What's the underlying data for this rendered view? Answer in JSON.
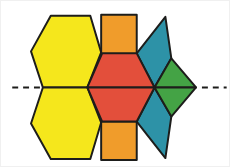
{
  "figure": {
    "canvas": {
      "width": 230,
      "height": 167,
      "background": "#ffffff"
    },
    "outline": {
      "color": "#1d1d1b",
      "width": 2
    },
    "colors": {
      "yellow": "#f5e71c",
      "orange": "#f09c2b",
      "red": "#e34f3b",
      "teal": "#2d92a7",
      "green": "#44a345"
    },
    "symmetry_line": {
      "color": "#1d1d1b",
      "width": 2,
      "dash": "6 5",
      "segments": [
        {
          "x1": 11,
          "y1": 87.5,
          "x2": 41,
          "y2": 87.5
        },
        {
          "x1": 203,
          "y1": 87.5,
          "x2": 228,
          "y2": 87.5
        }
      ]
    },
    "shapes": [
      {
        "name": "yellow-hexagon-top",
        "color": "yellow",
        "points": "30,51 50,15 90,15 101,52 87,87.5 42,87.5"
      },
      {
        "name": "yellow-hexagon-bottom",
        "color": "yellow",
        "points": "30,124 42,87.5 87,87.5 101,123 90,160 50,160"
      },
      {
        "name": "orange-square-top",
        "color": "orange",
        "points": "101,14 137,14 137,53 101,53"
      },
      {
        "name": "orange-square-bottom",
        "color": "orange",
        "points": "101,122 137,122 137,161 101,161"
      },
      {
        "name": "teal-rhombus-top",
        "color": "teal",
        "points": "155,87.5 137,53 166,16 172,58"
      },
      {
        "name": "teal-rhombus-bottom",
        "color": "teal",
        "points": "155,87.5 172,117 166,159 137,122"
      },
      {
        "name": "green-triangle-top",
        "color": "green",
        "points": "155,87.5 172,58 197,87.5"
      },
      {
        "name": "green-triangle-bottom",
        "color": "green",
        "points": "155,87.5 197,87.5 172,117"
      },
      {
        "name": "red-trapezoid-top",
        "color": "red",
        "points": "87,87.5 102,53 137,53 155,87.5"
      },
      {
        "name": "red-trapezoid-bottom",
        "color": "red",
        "points": "87,87.5 155,87.5 137,122 102,122"
      }
    ]
  }
}
